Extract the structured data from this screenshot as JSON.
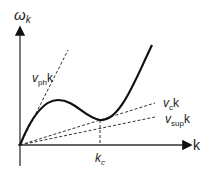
{
  "diagram": {
    "y_axis_label": "ω",
    "y_axis_sub": "k",
    "x_axis_label": "k",
    "lines": [
      {
        "name": "v_ph k",
        "main": "v",
        "sub": "ph",
        "tail": "k"
      },
      {
        "name": "v_c k",
        "main": "v",
        "sub": "c",
        "tail": "k"
      },
      {
        "name": "v_sup k",
        "main": "v",
        "sub": "sup",
        "tail": "k"
      }
    ],
    "marker": {
      "main": "k",
      "sub": "c"
    },
    "colors": {
      "stroke": "#111111",
      "dashed": "#333333"
    }
  }
}
